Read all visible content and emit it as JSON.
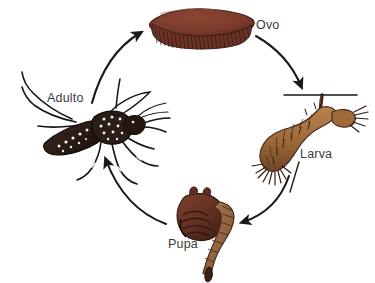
{
  "diagram": {
    "background_color": "#ffffff",
    "label_color": "#3a3a3a",
    "arrow_color": "#1a1a1a",
    "direction": "clockwise",
    "stages": [
      {
        "id": "ovo",
        "label": "Ovo",
        "icon": "egg-raft-icon",
        "description": "Jangada de ovos flutuante",
        "color": "#7a3b2c",
        "position": "top"
      },
      {
        "id": "larva",
        "label": "Larva",
        "icon": "larva-icon",
        "description": "Larva suspensa na superficie da agua",
        "color": "#a9713f",
        "position": "right"
      },
      {
        "id": "pupa",
        "label": "Pupa",
        "icon": "pupa-icon",
        "description": "Pupa em forma de virgula",
        "color": "#6d3526",
        "position": "bottom"
      },
      {
        "id": "adulto",
        "label": "Adulto",
        "icon": "adult-mosquito-icon",
        "description": "Mosquito adulto Aedes com manchas brancas",
        "color": "#2a1c16",
        "position": "left"
      }
    ],
    "arrows": [
      {
        "id": "adulto-to-ovo",
        "from": "Adulto",
        "to": "Ovo",
        "icon": "curved-arrow-icon"
      },
      {
        "id": "ovo-to-larva",
        "from": "Ovo",
        "to": "Larva",
        "icon": "curved-arrow-icon"
      },
      {
        "id": "larva-to-pupa",
        "from": "Larva",
        "to": "Pupa",
        "icon": "curved-arrow-icon"
      },
      {
        "id": "pupa-to-adulto",
        "from": "Pupa",
        "to": "Adulto",
        "icon": "curved-arrow-icon"
      }
    ],
    "water_line": {
      "id": "water-surface",
      "label": "",
      "color": "#1a1a1a"
    }
  }
}
